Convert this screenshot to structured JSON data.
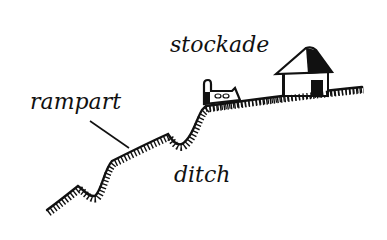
{
  "diagram": {
    "type": "hillfort-cross-section",
    "labels": {
      "stockade": "stockade",
      "rampart": "rampart",
      "ditch": "ditch"
    },
    "colors": {
      "ink": "#111111",
      "background": "#ffffff"
    }
  }
}
